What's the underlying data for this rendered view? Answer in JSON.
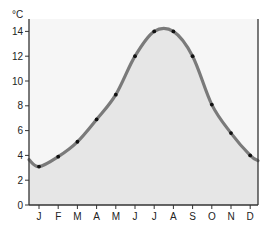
{
  "chart_data": {
    "type": "line",
    "title": "",
    "xlabel": "",
    "ylabel": "°C",
    "categories": [
      "J",
      "F",
      "M",
      "A",
      "M",
      "J",
      "J",
      "A",
      "S",
      "O",
      "N",
      "D"
    ],
    "series": [
      {
        "name": "Temperature",
        "values": [
          3.1,
          3.9,
          5.1,
          6.9,
          8.9,
          12.0,
          14.0,
          14.0,
          12.0,
          8.1,
          5.8,
          4.0
        ]
      }
    ],
    "ylim": [
      0,
      14.5
    ],
    "yticks": [
      0,
      2,
      4,
      6,
      8,
      10,
      12,
      14
    ],
    "grid": false,
    "legend": null,
    "area_fill": true
  },
  "colors": {
    "line": "#7a7a7a",
    "fill": "#e6e6e6",
    "plot_bg": "#f6f6f6",
    "marker": "#111111",
    "axis": "#333333"
  }
}
